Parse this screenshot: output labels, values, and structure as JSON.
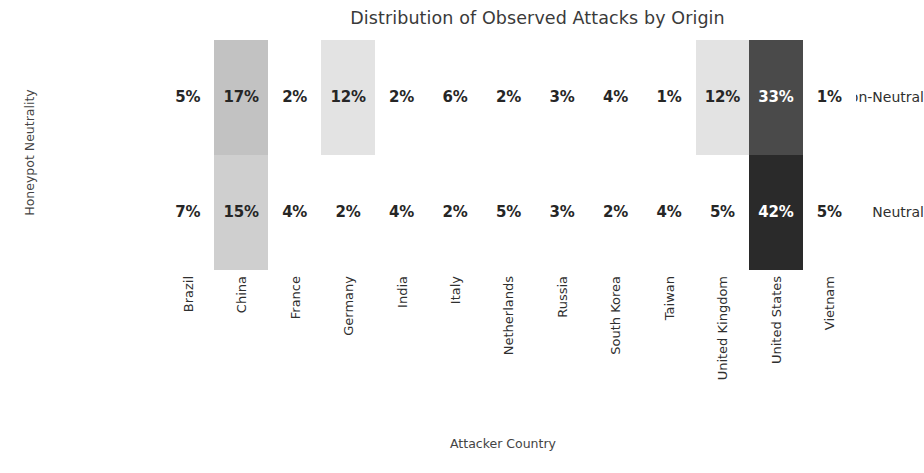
{
  "chart_data": {
    "type": "heatmap",
    "title": "Distribution of Observed Attacks by Origin",
    "xlabel": "Attacker Country",
    "ylabel": "Honeypot Neutrality",
    "categories": [
      "Brazil",
      "China",
      "France",
      "Germany",
      "India",
      "Italy",
      "Netherlands",
      "Russia",
      "South Korea",
      "Taiwan",
      "United Kingdom",
      "United States",
      "Vietnam"
    ],
    "rows": [
      "Non-Neutral",
      "Neutral"
    ],
    "unit": "%",
    "grid": false,
    "legend": "none",
    "colormap": "greys",
    "value_range": [
      1,
      42
    ],
    "series": [
      {
        "name": "Non-Neutral",
        "values": [
          5,
          17,
          2,
          12,
          2,
          6,
          2,
          3,
          4,
          1,
          12,
          33,
          1
        ],
        "labels": [
          "5%",
          "17%",
          "2%",
          "12%",
          "2%",
          "6%",
          "2%",
          "3%",
          "4%",
          "1%",
          "12%",
          "33%",
          "1%"
        ],
        "cell_colors": [
          "#ffffff",
          "#c2c2c2",
          "#ffffff",
          "#e3e3e3",
          "#ffffff",
          "#ffffff",
          "#ffffff",
          "#ffffff",
          "#ffffff",
          "#ffffff",
          "#e3e3e3",
          "#4a4a4a",
          "#ffffff"
        ],
        "text_colors": [
          "#262626",
          "#262626",
          "#262626",
          "#262626",
          "#262626",
          "#262626",
          "#262626",
          "#262626",
          "#262626",
          "#262626",
          "#262626",
          "#ffffff",
          "#262626"
        ]
      },
      {
        "name": "Neutral",
        "values": [
          7,
          15,
          4,
          2,
          4,
          2,
          5,
          3,
          2,
          4,
          5,
          42,
          5
        ],
        "labels": [
          "7%",
          "15%",
          "4%",
          "2%",
          "4%",
          "2%",
          "5%",
          "3%",
          "2%",
          "4%",
          "5%",
          "42%",
          "5%"
        ],
        "cell_colors": [
          "#ffffff",
          "#cfcfcf",
          "#ffffff",
          "#ffffff",
          "#ffffff",
          "#ffffff",
          "#ffffff",
          "#ffffff",
          "#ffffff",
          "#ffffff",
          "#ffffff",
          "#2a2a2a",
          "#ffffff"
        ],
        "text_colors": [
          "#262626",
          "#262626",
          "#262626",
          "#262626",
          "#262626",
          "#262626",
          "#262626",
          "#262626",
          "#262626",
          "#262626",
          "#262626",
          "#ffffff",
          "#262626"
        ]
      }
    ]
  }
}
